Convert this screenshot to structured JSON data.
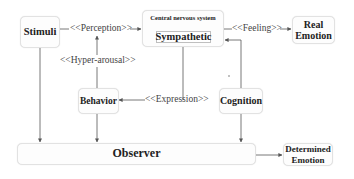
{
  "nodes": {
    "stimuli": {
      "label": "Stimuli"
    },
    "cns": {
      "title": "Central nervous system",
      "inner": "Sympathetic"
    },
    "real_emotion": {
      "line1": "Real",
      "line2": "Emotion"
    },
    "behavior": {
      "label": "Behavior"
    },
    "cognition": {
      "label": "Cognition"
    },
    "observer": {
      "label": "Observer"
    },
    "determined_emotion": {
      "line1": "Determined",
      "line2": "Emotion"
    }
  },
  "edges": {
    "perception": "<<Perception>>",
    "feeling": "<<Feeling>>",
    "hyper_arousal": "<<Hyper-arousal>>",
    "expression": "<<Expression>>"
  },
  "colors": {
    "line": "#555555",
    "box_border": "#e2e2e2"
  }
}
